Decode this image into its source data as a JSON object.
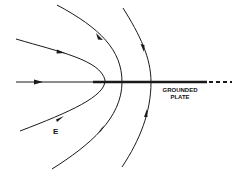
{
  "diagram": {
    "labels": {
      "field": "E",
      "plate_line1": "GROUNDED",
      "plate_line2": "PLATE"
    },
    "colors": {
      "line": "#1a1a1a",
      "background": "#ffffff"
    },
    "elements": [
      {
        "type": "axis-line",
        "description": "horizontal field line along axis, continues as thick grounded plate then dashed"
      },
      {
        "type": "field-line",
        "description": "innermost parabolic field line, vertex at plate edge"
      },
      {
        "type": "field-line",
        "description": "middle parabolic field line"
      },
      {
        "type": "field-line",
        "description": "outer parabolic field line"
      }
    ]
  }
}
